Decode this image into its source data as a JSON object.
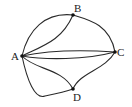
{
  "diagram": {
    "type": "multigraph",
    "nodes": [
      {
        "id": "A",
        "label": "A",
        "x": 22,
        "y": 56
      },
      {
        "id": "B",
        "label": "B",
        "x": 73,
        "y": 15
      },
      {
        "id": "C",
        "label": "C",
        "x": 115,
        "y": 52
      },
      {
        "id": "D",
        "label": "D",
        "x": 73,
        "y": 89
      }
    ],
    "edges": [
      {
        "from": "A",
        "to": "B",
        "variant": "outer"
      },
      {
        "from": "A",
        "to": "B",
        "variant": "inner"
      },
      {
        "from": "A",
        "to": "C",
        "variant": "upper"
      },
      {
        "from": "A",
        "to": "C",
        "variant": "lower"
      },
      {
        "from": "A",
        "to": "D",
        "variant": "inner"
      },
      {
        "from": "A",
        "to": "D",
        "variant": "outer"
      },
      {
        "from": "B",
        "to": "C"
      },
      {
        "from": "C",
        "to": "D"
      }
    ],
    "colors": {
      "edge": "#2a2a2a",
      "node": "#111111",
      "label": "#222222"
    }
  }
}
